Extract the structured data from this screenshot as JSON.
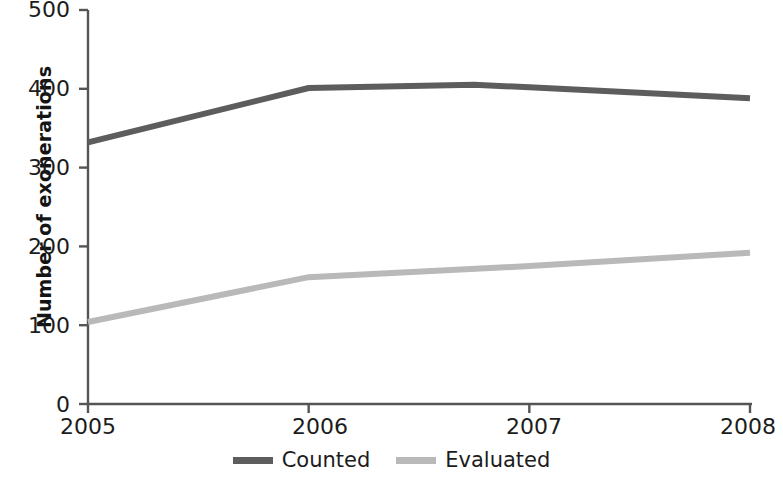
{
  "chart_data": {
    "type": "line",
    "title": "",
    "xlabel": "",
    "ylabel": "Number of exonerations",
    "x": [
      2005,
      2006,
      2007,
      2008
    ],
    "categories": [
      "2005",
      "2006",
      "2007",
      "2008"
    ],
    "xlim": [
      2005,
      2008
    ],
    "ylim": [
      0,
      500
    ],
    "ytick_labels": [
      "0",
      "100",
      "200",
      "300",
      "400",
      "500"
    ],
    "yticks": [
      0,
      100,
      200,
      300,
      400,
      500
    ],
    "xtick_labels": [
      "2005",
      "2006",
      "2007",
      "2008"
    ],
    "grid": false,
    "legend_position": "bottom",
    "series": [
      {
        "name": "Counted",
        "color": "#5d5d5d",
        "values": [
          332,
          401,
          402,
          388
        ],
        "detailed_x": [
          2005,
          2006,
          2006.75,
          2007,
          2008
        ],
        "detailed_values": [
          332,
          401,
          405,
          402,
          388
        ]
      },
      {
        "name": "Evaluated",
        "color": "#b9b9b9",
        "values": [
          104,
          161,
          175,
          192
        ],
        "detailed_x": [
          2005,
          2006,
          2007,
          2008
        ],
        "detailed_values": [
          104,
          161,
          175,
          192
        ]
      }
    ],
    "axis_color": "#555555"
  },
  "legend": {
    "items": [
      {
        "label": "Counted",
        "color": "#5d5d5d"
      },
      {
        "label": "Evaluated",
        "color": "#b9b9b9"
      }
    ]
  },
  "axes": {
    "y_title": "Number of exonerations",
    "y_labels": [
      "500",
      "400",
      "300",
      "200",
      "100",
      "0"
    ],
    "x_labels": [
      "2005",
      "2006",
      "2007",
      "2008"
    ]
  }
}
